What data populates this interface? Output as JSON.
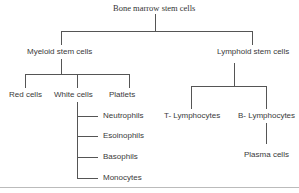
{
  "diagram": {
    "title": "Bone marrow stem cells",
    "branches": [
      {
        "label": "Myeloid stem cells",
        "children": [
          {
            "label": "Red cells"
          },
          {
            "label": "White cells",
            "children": [
              "Neutrophils",
              "Esoinophils",
              "Basophils",
              "Monocytes"
            ]
          },
          {
            "label": "Platlets"
          }
        ]
      },
      {
        "label": "Lymphoid stem cells",
        "children": [
          {
            "label": "T- Lymphocytes"
          },
          {
            "label": "B- Lymphocytes",
            "children": [
              "Plasma cells"
            ]
          }
        ]
      }
    ]
  },
  "nodes": {
    "root": "Bone marrow stem cells",
    "myeloid": "Myeloid stem cells",
    "lymphoid": "Lymphoid stem cells",
    "red": "Red cells",
    "white": "White cells",
    "platelets": "Platlets",
    "neutrophils": "Neutrophils",
    "eosinophils": "Esoinophils",
    "basophils": "Basophils",
    "monocytes": "Monocytes",
    "tlymph": "T- Lymphocytes",
    "blymph": "B- Lymphocytes",
    "plasma": "Plasma cells"
  }
}
